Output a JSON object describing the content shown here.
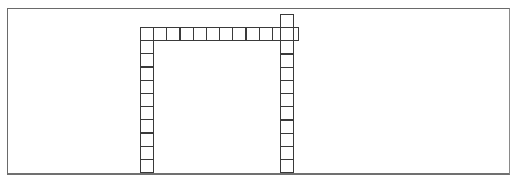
{
  "diagram": {
    "title": "",
    "frame": {
      "x": 7,
      "y": 8,
      "width": 502,
      "height": 165,
      "border_color": "#6a6a6a"
    },
    "cell_size": 13.2,
    "cell_border_color": "#3a3a3a",
    "structures": [
      {
        "name": "left-column",
        "orientation": "vertical",
        "x": 140,
        "y": 27,
        "count": 11
      },
      {
        "name": "top-row",
        "orientation": "horizontal",
        "x": 140,
        "y": 27,
        "count": 12
      },
      {
        "name": "right-column",
        "orientation": "vertical",
        "x": 280,
        "y": 14,
        "count": 12
      }
    ]
  },
  "caption": ""
}
